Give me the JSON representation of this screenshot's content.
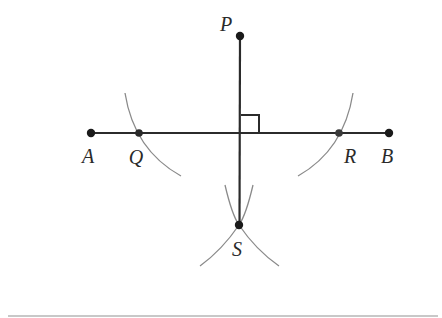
{
  "diagram": {
    "colors": {
      "line": "#2b2b2b",
      "arc": "#8a8a8a",
      "point": "#1a1a1a",
      "label": "#2a2a2a",
      "rule": "#c8c8c8"
    },
    "points": [
      {
        "id": "P",
        "label": "P",
        "x": 240,
        "y": 36,
        "label_x": 226,
        "label_y": 24
      },
      {
        "id": "A",
        "label": "A",
        "x": 91,
        "y": 133,
        "label_x": 88,
        "label_y": 156
      },
      {
        "id": "Q",
        "label": "Q",
        "x": 139,
        "y": 133,
        "label_x": 136,
        "label_y": 157
      },
      {
        "id": "R",
        "label": "R",
        "x": 339,
        "y": 133,
        "label_x": 350,
        "label_y": 156
      },
      {
        "id": "B",
        "label": "B",
        "x": 389,
        "y": 133,
        "label_x": 387,
        "label_y": 156
      },
      {
        "id": "S",
        "label": "S",
        "x": 239,
        "y": 225,
        "label_x": 237,
        "label_y": 249
      }
    ],
    "segments": [
      {
        "name": "AB",
        "from": "A",
        "to": "B"
      },
      {
        "name": "PS",
        "from": "P",
        "to": "S"
      }
    ],
    "right_angle": {
      "at": "foot of perpendicular on AB",
      "x": 241,
      "y": 115,
      "size": 18
    },
    "arcs": [
      {
        "name": "arc-through-Q",
        "center": "P"
      },
      {
        "name": "arc-through-R",
        "center": "P"
      },
      {
        "name": "arc-from-Q-through-S",
        "center": "Q"
      },
      {
        "name": "arc-from-R-through-S",
        "center": "R"
      }
    ]
  }
}
